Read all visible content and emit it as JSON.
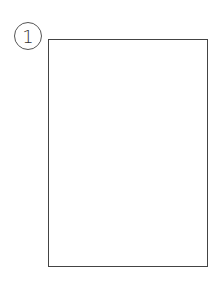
{
  "diagram": {
    "label_number": "1",
    "shape": "rectangle"
  }
}
